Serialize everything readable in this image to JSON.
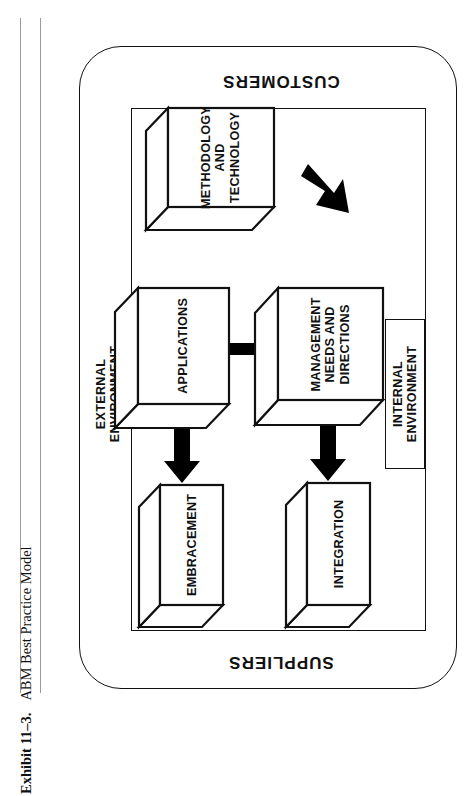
{
  "caption": {
    "number": "Exhibit 11–3.",
    "title": "ABM Best Practice Model"
  },
  "diagram": {
    "type": "flow",
    "orientation": "rotated-180",
    "outer_container_label_top": "SUPPLIERS",
    "outer_container_label_bottom": "CUSTOMERS",
    "bands": {
      "customers": "CUSTOMERS",
      "suppliers": "SUPPLIERS"
    },
    "environments": {
      "internal": "INTERNAL\nENVIRONMENT",
      "internal_line1": "INTERNAL",
      "internal_line2": "ENVIRONMENT",
      "external": "EXTERNAL\nENVIRONMENT",
      "external_line1": "EXTERNAL",
      "external_line2": "ENVIRONMENT"
    },
    "nodes": [
      {
        "id": "methodology",
        "label_lines": [
          "METHODOLOGY",
          "AND",
          "TECHNOLOGY"
        ]
      },
      {
        "id": "management",
        "label_lines": [
          "MANAGEMENT",
          "NEEDS AND",
          "DIRECTIONS"
        ]
      },
      {
        "id": "applications",
        "label_lines": [
          "APPLICATIONS"
        ]
      },
      {
        "id": "integration",
        "label_lines": [
          "INTEGRATION"
        ]
      },
      {
        "id": "embracement",
        "label_lines": [
          "EMBRACEMENT"
        ]
      }
    ],
    "edges": [
      {
        "from": "methodology",
        "to": "management",
        "style": "solid-block-arrow"
      },
      {
        "from": "methodology",
        "to": "applications",
        "style": "solid-block-arrow"
      },
      {
        "from": "management",
        "to": "applications",
        "style": "solid-block-arrow"
      },
      {
        "from": "management",
        "to": "integration",
        "style": "solid-block-arrow"
      },
      {
        "from": "applications",
        "to": "embracement",
        "style": "solid-block-arrow"
      }
    ],
    "colors": {
      "stroke": "#111111",
      "fill": "#ffffff",
      "arrow": "#000000",
      "page": "#ffffff"
    }
  }
}
